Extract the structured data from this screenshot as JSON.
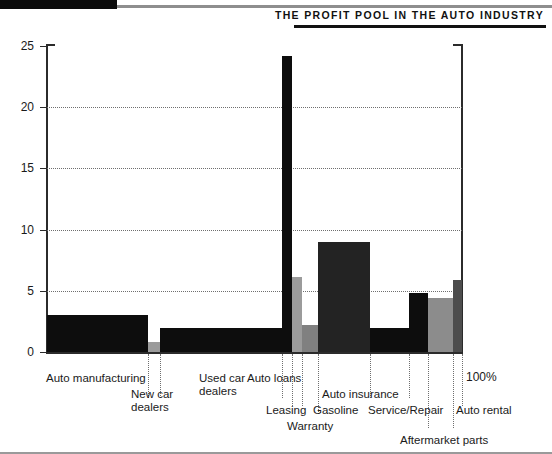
{
  "header": {
    "title": "The Profit Pool in the Auto Industry"
  },
  "axis": {
    "y_ticks": [
      "0",
      "5",
      "10",
      "15",
      "20",
      "25"
    ],
    "x_end_label": "100%"
  },
  "chart_data": {
    "type": "bar",
    "title": "The Profit Pool in the Auto Industry",
    "xlabel": "",
    "ylabel": "",
    "ylim": [
      0,
      25
    ],
    "xlim": [
      0,
      100
    ],
    "grid": true,
    "legend": null,
    "note": "Marimekko-style profit pool: bar width = share of industry revenue (cumulative to 100%), bar height = operating profit margin / profit pool value",
    "categories": [
      "Auto manufacturing",
      "New car dealers",
      "Used car dealers",
      "Auto loans",
      "Leasing",
      "Warranty",
      "Auto insurance",
      "Gasoline",
      "Service/Repair",
      "Aftermarket parts",
      "Auto rental"
    ],
    "values": [
      3.0,
      0.85,
      2.0,
      24.2,
      6.1,
      2.2,
      9.0,
      2.0,
      4.8,
      4.4,
      5.9
    ],
    "widths": [
      24.3,
      3.0,
      29.4,
      2.4,
      2.4,
      3.9,
      12.5,
      9.4,
      4.6,
      6.0,
      2.1
    ],
    "colors": [
      "#0d0d0d",
      "#9b9b9b",
      "#0d0d0d",
      "#0d0d0d",
      "#9b9b9b",
      "#808080",
      "#232323",
      "#0d0d0d",
      "#0d0d0d",
      "#8c8c8c",
      "#4d4d4d"
    ]
  }
}
